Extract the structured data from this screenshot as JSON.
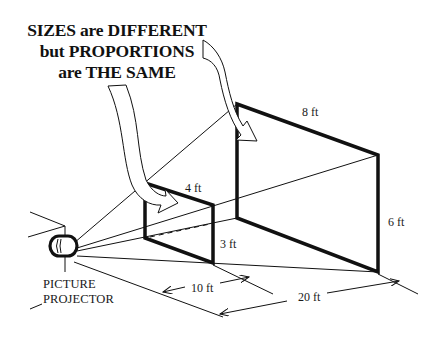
{
  "headline": {
    "line1": "SIZES are DIFFERENT",
    "line2": "but PROPORTIONS",
    "line3": "are THE SAME"
  },
  "projector": {
    "label_line1": "PICTURE",
    "label_line2": "PROJECTOR"
  },
  "small_frame": {
    "width_label": "4 ft",
    "height_label": "3 ft",
    "distance_label": "10 ft"
  },
  "large_frame": {
    "width_label": "8 ft",
    "height_label": "6 ft",
    "distance_label": "20 ft"
  },
  "colors": {
    "ink": "#111111",
    "background": "#ffffff"
  }
}
